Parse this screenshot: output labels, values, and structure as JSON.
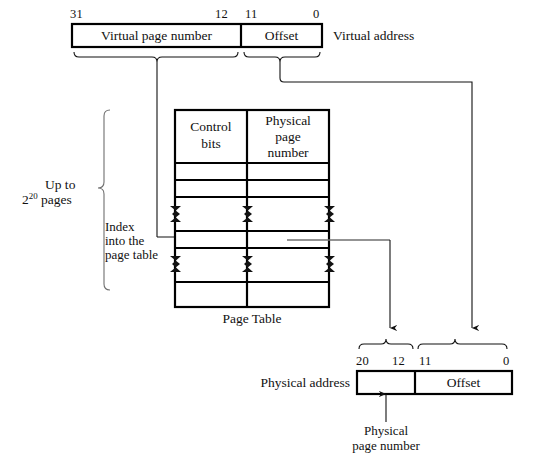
{
  "figure": {
    "virtual_address": {
      "label": "Virtual  address",
      "bits": {
        "high": "31",
        "mid_left": "12",
        "mid_right": "11",
        "low": "0"
      },
      "fields": [
        {
          "name": "virtual-page-number",
          "text": "Virtual page number"
        },
        {
          "name": "offset",
          "text": "Offset"
        }
      ]
    },
    "page_table": {
      "caption": "Page  Table",
      "columns": [
        {
          "name": "control-bits",
          "text": "Control\nbits",
          "line1": "Control",
          "line2": "bits"
        },
        {
          "name": "physical-page-number",
          "line1": "Physical",
          "line2": "page",
          "line3": "number"
        }
      ],
      "row_count": 8,
      "break_row_indices": [
        3,
        5
      ]
    },
    "annotations": {
      "capacity": {
        "line1": "Up to",
        "line2_base": "2",
        "line2_exp": "20",
        "line2_rest": " pages"
      },
      "index": {
        "line1": "Index",
        "line2": "into the",
        "line3": "page table"
      },
      "physical_address_label": "Physical  address",
      "physical_page_number_caption": {
        "line1": "Physical",
        "line2": "page  number"
      }
    },
    "physical_address": {
      "bits": {
        "high": "20",
        "mid_left": "12",
        "mid_right": "11",
        "low": "0"
      },
      "fields": [
        {
          "name": "physical-page-number-field",
          "text": ""
        },
        {
          "name": "offset-field",
          "text": "Offset"
        }
      ]
    },
    "colors": {
      "ink": "#111111",
      "rule": "#000000",
      "thin": "#6f6f6f",
      "background": "#ffffff"
    }
  }
}
